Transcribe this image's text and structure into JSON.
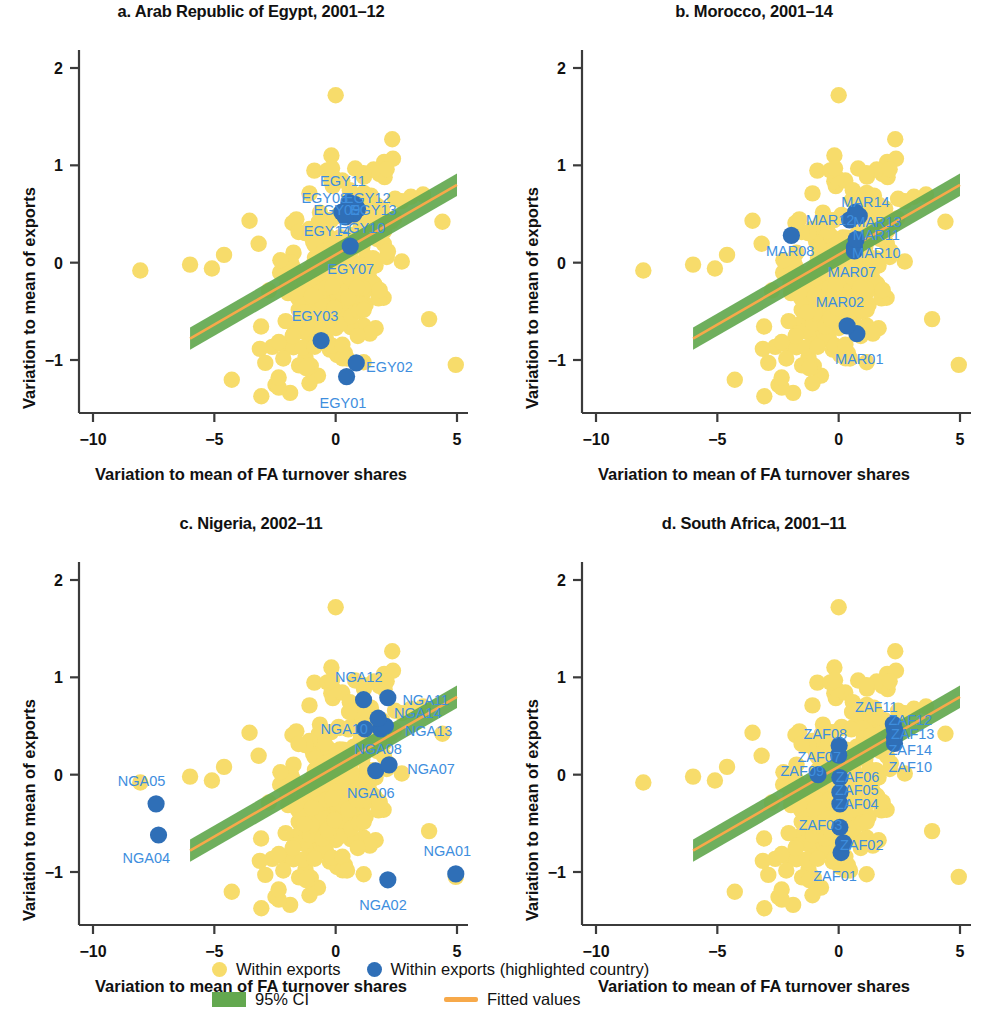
{
  "figure": {
    "axis_label_x": "Variation to mean of FA turnover shares",
    "axis_label_y": "Variation to mean of exports"
  },
  "legend": {
    "items": [
      {
        "id": "within-exports",
        "label": "Within exports",
        "marker": "dot",
        "color": "#F7DC6B"
      },
      {
        "id": "within-exports-highlighted",
        "label": "Within exports (highlighted country)",
        "marker": "dot",
        "color": "#2F6FB7"
      },
      {
        "id": "ci",
        "label": "95% CI",
        "marker": "box",
        "color": "#63A84F"
      },
      {
        "id": "fit",
        "label": "Fitted values",
        "marker": "line",
        "color": "#F7A94A"
      }
    ]
  },
  "chart_data": {
    "type": "scatter",
    "xlabel": "Variation to mean of FA turnover shares",
    "ylabel": "Variation to mean of exports",
    "xlim": [
      -11.4,
      5.5
    ],
    "ylim": [
      -1.55,
      2.35
    ],
    "xticks": [
      -10,
      -5,
      0,
      5
    ],
    "xticklabels": [
      "−10",
      "−5",
      "0",
      "5"
    ],
    "yticks": [
      -1,
      0,
      1,
      2
    ],
    "yticklabels": [
      "−1",
      "0",
      "1",
      "2"
    ],
    "grid": false,
    "legend_position": "bottom",
    "fit_line": {
      "color": "#F7A94A",
      "ci_color": "#63A84F",
      "x_start": -6.0,
      "x_end": 5.0,
      "y_start": -0.78,
      "y_end": 0.8,
      "ci_halfwidth_start": 0.115,
      "ci_halfwidth_end": 0.115
    },
    "background_series": {
      "name": "Within exports",
      "color": "#F7DC6B",
      "n_points": 310,
      "note": "Dense yellow cloud centered near (0, -0.1) with one outlier near (0, 1.72) and scattered points near (-8, -0.1), (5, -1.05)"
    },
    "panels": [
      {
        "id": "egypt",
        "title": "a. Arab Republic of Egypt, 2001–12",
        "country_code": "EGY",
        "highlighted_color": "#2F6FB7",
        "points": [
          {
            "label": "EGY01",
            "x": 0.45,
            "y": -1.17,
            "lx": 0.3,
            "ly": -1.44,
            "anchor": "middle"
          },
          {
            "label": "EGY02",
            "x": 0.85,
            "y": -1.03,
            "lx": 1.25,
            "ly": -1.07,
            "anchor": "start"
          },
          {
            "label": "EGY03",
            "x": -0.6,
            "y": -0.8,
            "lx": -0.85,
            "ly": -0.55,
            "anchor": "middle"
          },
          {
            "label": "EGY07",
            "x": 0.6,
            "y": 0.17,
            "lx": 0.62,
            "ly": -0.07,
            "anchor": "middle"
          },
          {
            "label": "EGY08",
            "x": 0.25,
            "y": 0.52,
            "lx": -0.45,
            "ly": 0.66,
            "anchor": "middle"
          },
          {
            "label": "EGY09",
            "x": 0.35,
            "y": 0.53,
            "lx": 0.05,
            "ly": 0.54,
            "anchor": "middle"
          },
          {
            "label": "EGY10",
            "x": 0.75,
            "y": 0.5,
            "lx": 1.08,
            "ly": 0.36,
            "anchor": "middle"
          },
          {
            "label": "EGY11",
            "x": 0.55,
            "y": 0.62,
            "lx": 0.3,
            "ly": 0.84,
            "anchor": "middle"
          },
          {
            "label": "EGY12",
            "x": 0.8,
            "y": 0.6,
            "lx": 1.3,
            "ly": 0.66,
            "anchor": "middle"
          },
          {
            "label": "EGY13",
            "x": 0.9,
            "y": 0.55,
            "lx": 1.55,
            "ly": 0.54,
            "anchor": "middle"
          },
          {
            "label": "EGY14",
            "x": 0.4,
            "y": 0.47,
            "lx": -0.35,
            "ly": 0.33,
            "anchor": "middle"
          }
        ]
      },
      {
        "id": "morocco",
        "title": "b. Morocco, 2001–14",
        "country_code": "MAR",
        "highlighted_color": "#2F6FB7",
        "points": [
          {
            "label": "MAR01",
            "x": 0.75,
            "y": -0.73,
            "lx": 0.85,
            "ly": -0.99,
            "anchor": "middle"
          },
          {
            "label": "MAR02",
            "x": 0.35,
            "y": -0.65,
            "lx": 0.05,
            "ly": -0.4,
            "anchor": "middle"
          },
          {
            "label": "MAR07",
            "x": 0.65,
            "y": 0.12,
            "lx": 0.55,
            "ly": -0.1,
            "anchor": "middle"
          },
          {
            "label": "MAR08",
            "x": -1.95,
            "y": 0.28,
            "lx": -2.0,
            "ly": 0.12,
            "anchor": "middle"
          },
          {
            "label": "MAR10",
            "x": 0.65,
            "y": 0.16,
            "lx": 1.55,
            "ly": 0.1,
            "anchor": "middle"
          },
          {
            "label": "MAR11",
            "x": 0.72,
            "y": 0.24,
            "lx": 1.55,
            "ly": 0.28,
            "anchor": "middle"
          },
          {
            "label": "MAR12",
            "x": 0.45,
            "y": 0.44,
            "lx": -0.35,
            "ly": 0.44,
            "anchor": "middle"
          },
          {
            "label": "MAR13",
            "x": 0.85,
            "y": 0.48,
            "lx": 1.6,
            "ly": 0.42,
            "anchor": "middle"
          },
          {
            "label": "MAR14",
            "x": 0.7,
            "y": 0.52,
            "lx": 1.1,
            "ly": 0.62,
            "anchor": "middle"
          }
        ]
      },
      {
        "id": "nigeria",
        "title": "c. Nigeria, 2002–11",
        "country_code": "NGA",
        "highlighted_color": "#2F6FB7",
        "points": [
          {
            "label": "NGA01",
            "x": 4.95,
            "y": -1.02,
            "lx": 4.6,
            "ly": -0.78,
            "anchor": "middle"
          },
          {
            "label": "NGA02",
            "x": 2.15,
            "y": -1.08,
            "lx": 1.95,
            "ly": -1.34,
            "anchor": "middle"
          },
          {
            "label": "NGA04",
            "x": -7.3,
            "y": -0.62,
            "lx": -7.8,
            "ly": -0.86,
            "anchor": "middle"
          },
          {
            "label": "NGA05",
            "x": -7.4,
            "y": -0.3,
            "lx": -8.0,
            "ly": -0.06,
            "anchor": "middle"
          },
          {
            "label": "NGA06",
            "x": 1.65,
            "y": 0.04,
            "lx": 1.45,
            "ly": -0.19,
            "anchor": "middle"
          },
          {
            "label": "NGA07",
            "x": 2.2,
            "y": 0.1,
            "lx": 2.95,
            "ly": 0.06,
            "anchor": "start"
          },
          {
            "label": "NGA08",
            "x": 1.85,
            "y": 0.47,
            "lx": 1.75,
            "ly": 0.26,
            "anchor": "middle"
          },
          {
            "label": "NGA10",
            "x": 1.2,
            "y": 0.47,
            "lx": 0.35,
            "ly": 0.47,
            "anchor": "middle"
          },
          {
            "label": "NGA11",
            "x": 2.15,
            "y": 0.79,
            "lx": 2.75,
            "ly": 0.77,
            "anchor": "start"
          },
          {
            "label": "NGA12",
            "x": 1.15,
            "y": 0.77,
            "lx": 0.95,
            "ly": 1.0,
            "anchor": "middle"
          },
          {
            "label": "NGA13",
            "x": 2.05,
            "y": 0.5,
            "lx": 2.85,
            "ly": 0.45,
            "anchor": "start"
          },
          {
            "label": "NGA14",
            "x": 1.75,
            "y": 0.58,
            "lx": 2.4,
            "ly": 0.63,
            "anchor": "start"
          }
        ]
      },
      {
        "id": "south-africa",
        "title": "d. South Africa, 2001–11",
        "country_code": "ZAF",
        "highlighted_color": "#2F6FB7",
        "points": [
          {
            "label": "ZAF01",
            "x": 0.1,
            "y": -0.8,
            "lx": -0.15,
            "ly": -1.04,
            "anchor": "middle"
          },
          {
            "label": "ZAF02",
            "x": 0.2,
            "y": -0.7,
            "lx": 0.95,
            "ly": -0.72,
            "anchor": "middle"
          },
          {
            "label": "ZAF03",
            "x": 0.05,
            "y": -0.54,
            "lx": -0.75,
            "ly": -0.52,
            "anchor": "middle"
          },
          {
            "label": "ZAF04",
            "x": 0.05,
            "y": -0.3,
            "lx": 0.75,
            "ly": -0.3,
            "anchor": "middle"
          },
          {
            "label": "ZAF05",
            "x": 0.05,
            "y": -0.18,
            "lx": 0.75,
            "ly": -0.16,
            "anchor": "middle"
          },
          {
            "label": "ZAF06",
            "x": 0.05,
            "y": -0.03,
            "lx": 0.78,
            "ly": -0.02,
            "anchor": "middle"
          },
          {
            "label": "ZAF07",
            "x": 0.0,
            "y": 0.2,
            "lx": -0.8,
            "ly": 0.18,
            "anchor": "middle"
          },
          {
            "label": "ZAF08",
            "x": 0.02,
            "y": 0.3,
            "lx": -0.55,
            "ly": 0.42,
            "anchor": "middle"
          },
          {
            "label": "ZAF09",
            "x": -0.85,
            "y": 0.0,
            "lx": -1.5,
            "ly": 0.04,
            "anchor": "middle"
          },
          {
            "label": "ZAF10",
            "x": 2.3,
            "y": 0.32,
            "lx": 2.95,
            "ly": 0.08,
            "anchor": "middle"
          },
          {
            "label": "ZAF11",
            "x": 2.25,
            "y": 0.52,
            "lx": 1.55,
            "ly": 0.7,
            "anchor": "middle"
          },
          {
            "label": "ZAF12",
            "x": 2.3,
            "y": 0.46,
            "lx": 2.95,
            "ly": 0.56,
            "anchor": "middle"
          },
          {
            "label": "ZAF13",
            "x": 2.35,
            "y": 0.43,
            "lx": 3.05,
            "ly": 0.42,
            "anchor": "middle"
          },
          {
            "label": "ZAF14",
            "x": 2.3,
            "y": 0.38,
            "lx": 2.95,
            "ly": 0.25,
            "anchor": "middle"
          }
        ]
      }
    ]
  }
}
